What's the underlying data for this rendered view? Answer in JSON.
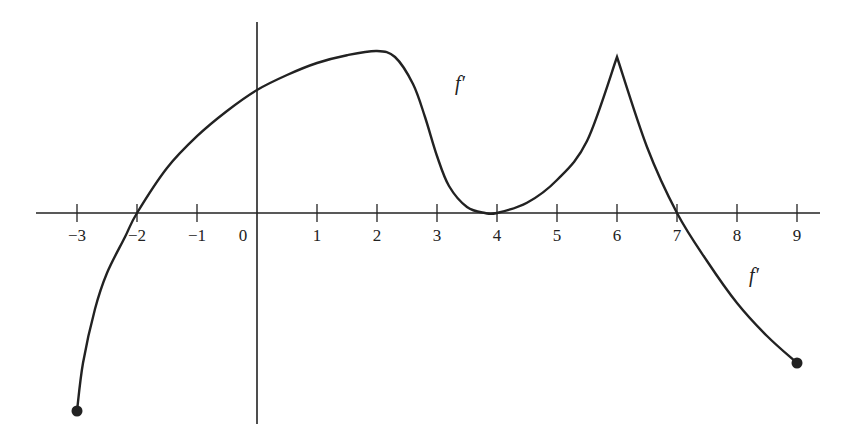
{
  "chart_data": {
    "type": "line",
    "title": "",
    "xlabel": "",
    "ylabel": "",
    "curve_label": "f′",
    "curve_label_positions": [
      {
        "x": 3.3,
        "y": 2.05
      },
      {
        "x": 8.2,
        "y": -1.15
      }
    ],
    "xlim": [
      -3.6,
      9.4
    ],
    "ylim": [
      -3.5,
      3.2
    ],
    "x_ticks": [
      -3,
      -2,
      -1,
      0,
      1,
      2,
      3,
      4,
      5,
      6,
      7,
      8,
      9
    ],
    "x_tick_labels": [
      "−3",
      "−2",
      "−1",
      "0",
      "1",
      "2",
      "3",
      "4",
      "5",
      "6",
      "7",
      "8",
      "9"
    ],
    "y_ticks": [],
    "grid": false,
    "legend": null,
    "series": [
      {
        "name": "f′",
        "color": "#222222",
        "x": [
          -3,
          -2.9,
          -2.7,
          -2.5,
          -2.2,
          -2,
          -1.5,
          -1,
          -0.5,
          0,
          0.5,
          1,
          1.5,
          2,
          2.3,
          2.6,
          2.8,
          3,
          3.2,
          3.5,
          3.8,
          4,
          4.5,
          5,
          5.5,
          6,
          6.5,
          7,
          7.5,
          8,
          8.5,
          9
        ],
        "y": [
          -3.3,
          -2.5,
          -1.6,
          -1.0,
          -0.4,
          0,
          0.75,
          1.28,
          1.7,
          2.05,
          2.3,
          2.5,
          2.63,
          2.7,
          2.6,
          2.15,
          1.6,
          0.95,
          0.45,
          0.1,
          0.0,
          0.0,
          0.17,
          0.55,
          1.2,
          2.6,
          1.1,
          0.0,
          -0.8,
          -1.5,
          -2.05,
          -2.5
        ]
      }
    ],
    "annotations": [
      {
        "type": "closed-dot",
        "x": -3,
        "y": -3.3
      },
      {
        "type": "closed-dot",
        "x": 9,
        "y": -2.5
      },
      {
        "type": "cusp",
        "x": 6,
        "y": 2.6
      },
      {
        "type": "zero",
        "x": -2,
        "y": 0
      },
      {
        "type": "tangent-zero",
        "x": 4,
        "y": 0
      },
      {
        "type": "zero",
        "x": 7,
        "y": 0
      }
    ]
  },
  "axes": {
    "origin_label": "0"
  }
}
